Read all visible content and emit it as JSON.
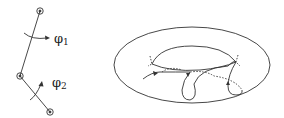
{
  "figure": {
    "left_panel": {
      "description": "double pendulum",
      "angle_labels": [
        {
          "symbol": "φ",
          "subscript": "1"
        },
        {
          "symbol": "φ",
          "subscript": "2"
        }
      ]
    },
    "right_panel": {
      "description": "torus with trajectory"
    },
    "colors": {
      "line": "#333333",
      "background": "#ffffff"
    }
  }
}
